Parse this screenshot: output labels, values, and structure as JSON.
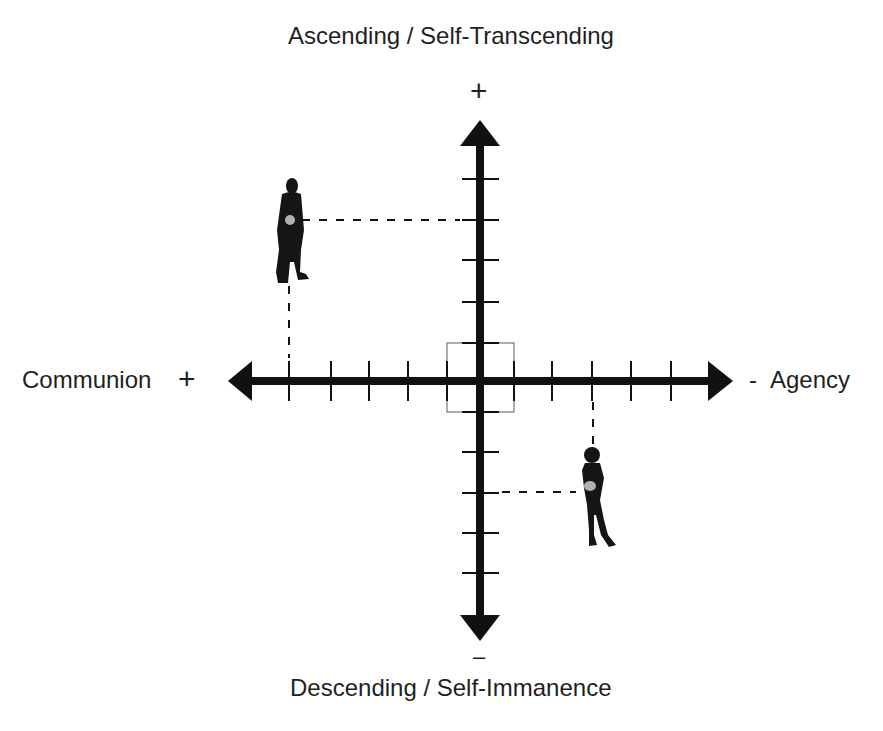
{
  "title_top": "Ascending / Self-Transcending",
  "title_bottom": "Descending / Self-Immanence",
  "axis_left_label": "Communion",
  "axis_right_label": "Agency",
  "signs": {
    "top": "+",
    "bottom": "–",
    "left": "+",
    "right": "-"
  },
  "colors": {
    "axis": "#111111",
    "marker": "#b0b0b0",
    "box": "#777777",
    "text": "#1f1f1f"
  },
  "diagram": {
    "type": "quadrant-axes",
    "horizontal_axis": {
      "left": "Communion (+)",
      "right": "Agency (-)",
      "ticks_each_side": 5
    },
    "vertical_axis": {
      "top": "Ascending / Self-Transcending (+)",
      "bottom": "Descending / Self-Immanence (-)",
      "ticks_each_side": 5
    },
    "center_box": true,
    "figures": [
      {
        "name": "man",
        "quadrant": "upper-left",
        "x_tick": -5,
        "y_tick": 4
      },
      {
        "name": "woman",
        "quadrant": "lower-right",
        "x_tick": 3,
        "y_tick": -3
      }
    ]
  }
}
